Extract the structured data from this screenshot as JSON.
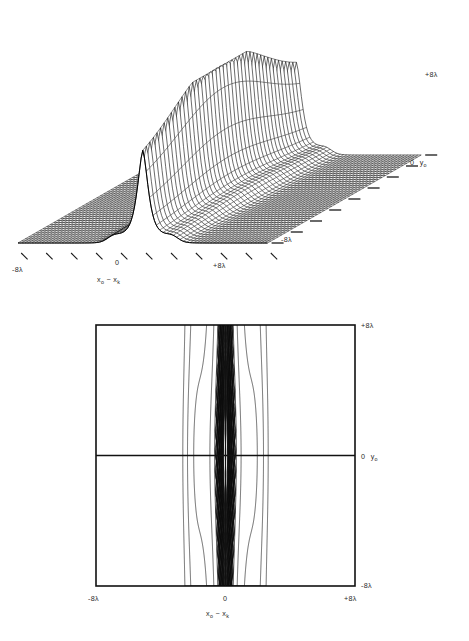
{
  "figure": {
    "kind": "two-panel scientific figure",
    "background_color": "#ffffff",
    "ink_color": "#1a1a1a"
  },
  "panel_a": {
    "name": "three-dimensional-surface-plot",
    "plot_type": "3d-mesh-surface",
    "x_axis": {
      "label": "x",
      "label_sub": "o",
      "label_tail": " − x",
      "label_tail_sub": "k",
      "ticks": [
        "-8λ",
        "0",
        "+8λ"
      ],
      "tick_count": 11,
      "min_label": "-8λ",
      "zero_label": "0",
      "max_label": "+8λ"
    },
    "y_axis": {
      "label": "y",
      "label_sub": "o",
      "ticks": [
        "+8λ",
        "0 y₀",
        "-8λ"
      ],
      "tick_count": 9,
      "max_label": "+8λ",
      "zero_label": "0",
      "zero_var": "y",
      "zero_var_sub": "o",
      "min_label": "-8λ"
    }
  },
  "panel_b": {
    "name": "contour-plot",
    "plot_type": "contour",
    "x_axis": {
      "label": "x",
      "label_sub": "o",
      "label_tail": " − x",
      "label_tail_sub": "k",
      "min_label": "-8λ",
      "zero_label": "0",
      "max_label": "+8λ"
    },
    "y_axis": {
      "label": "y",
      "label_sub": "o",
      "max_label": "+8λ",
      "zero_label": "0",
      "zero_var": "y",
      "zero_var_sub": "o",
      "min_label": "-8λ"
    },
    "frame": {
      "x": 96,
      "y": 325,
      "width": 259,
      "height": 261
    },
    "crosshair": {
      "h_at_y0": true,
      "v_at_x0": true
    }
  },
  "chart_data": {
    "type": "heatmap",
    "title": "",
    "subtitle": "",
    "xlabel": "x₀ − xₖ",
    "ylabel": "y₀",
    "xlim": [
      -8,
      8
    ],
    "ylim": [
      -8,
      8
    ],
    "x_unit": "λ",
    "y_unit": "λ",
    "xtick_labels": [
      "-8λ",
      "0",
      "+8λ"
    ],
    "ytick_labels": [
      "-8λ",
      "0",
      "+8λ"
    ],
    "grid": false,
    "legend": "none",
    "contour_levels": [
      0.02,
      0.05,
      0.1,
      0.2,
      0.35,
      0.5,
      0.7,
      0.9
    ],
    "ridge": {
      "center_x": 0.0,
      "half_width_x": 0.45,
      "shoulder_half_width_x": 1.6,
      "peak_value": 1.0,
      "y_extent": [
        -8,
        8
      ]
    },
    "surface_samples_x": [
      -8,
      -6,
      -4,
      -3,
      -2,
      -1.5,
      -1,
      -0.6,
      -0.3,
      0,
      0.3,
      0.6,
      1,
      1.5,
      2,
      3,
      4,
      6,
      8
    ],
    "surface_samples_z": [
      0.004,
      0.006,
      0.012,
      0.02,
      0.05,
      0.1,
      0.24,
      0.48,
      0.8,
      1.0,
      0.8,
      0.48,
      0.24,
      0.1,
      0.05,
      0.02,
      0.012,
      0.006,
      0.004
    ]
  }
}
